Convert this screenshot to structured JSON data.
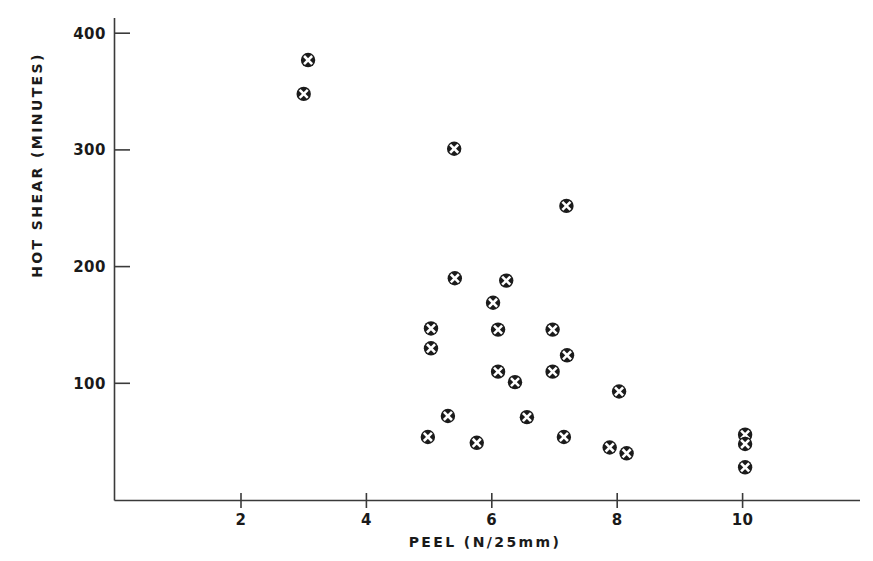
{
  "chart_data": {
    "type": "scatter",
    "title": "",
    "xlabel": "PEEL (N/25mm)",
    "ylabel": "HOT SHEAR (MINUTES)",
    "xlim": [
      0,
      12
    ],
    "ylim": [
      0,
      420
    ],
    "grid": false,
    "legend": null,
    "marker": "circle-with-white-cross",
    "marker_color": "#1b1b1b",
    "xticks": [
      2,
      4,
      6,
      8,
      10
    ],
    "xtick_labels": [
      "2",
      "4",
      "6",
      "8",
      "10"
    ],
    "yticks": [
      100,
      200,
      300,
      400
    ],
    "ytick_labels": [
      "100",
      "200",
      "300",
      "400"
    ],
    "series": [
      {
        "name": "samples",
        "points": [
          {
            "x": 3.07,
            "y": 377
          },
          {
            "x": 3.0,
            "y": 348
          },
          {
            "x": 5.4,
            "y": 301
          },
          {
            "x": 7.19,
            "y": 252
          },
          {
            "x": 5.41,
            "y": 190
          },
          {
            "x": 6.23,
            "y": 188
          },
          {
            "x": 6.02,
            "y": 169
          },
          {
            "x": 5.03,
            "y": 147
          },
          {
            "x": 6.1,
            "y": 146
          },
          {
            "x": 6.97,
            "y": 146
          },
          {
            "x": 5.03,
            "y": 130
          },
          {
            "x": 7.2,
            "y": 124
          },
          {
            "x": 6.1,
            "y": 110
          },
          {
            "x": 6.97,
            "y": 110
          },
          {
            "x": 6.37,
            "y": 101
          },
          {
            "x": 8.03,
            "y": 93
          },
          {
            "x": 5.3,
            "y": 72
          },
          {
            "x": 6.56,
            "y": 71
          },
          {
            "x": 4.98,
            "y": 54
          },
          {
            "x": 5.76,
            "y": 49
          },
          {
            "x": 7.15,
            "y": 54
          },
          {
            "x": 7.88,
            "y": 45
          },
          {
            "x": 8.15,
            "y": 40
          },
          {
            "x": 10.04,
            "y": 56
          },
          {
            "x": 10.04,
            "y": 48
          },
          {
            "x": 10.04,
            "y": 28
          }
        ]
      }
    ]
  },
  "axes": {
    "x_axis_title": "PEEL (N/25mm)",
    "y_axis_title": "HOT SHEAR (MINUTES)"
  }
}
